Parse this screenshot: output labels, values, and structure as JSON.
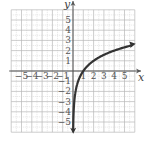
{
  "chart_data": {
    "type": "line",
    "title": "",
    "function": "y = log2(x)",
    "xlabel": "x",
    "ylabel": "y",
    "xlim": [
      -6,
      6
    ],
    "ylim": [
      -6,
      6
    ],
    "grid": true,
    "minor_grid": "dotted half-unit",
    "x_ticks": [
      "-5",
      "-4",
      "-3",
      "-2",
      "-1",
      "1",
      "2",
      "3",
      "4",
      "5"
    ],
    "y_ticks": [
      "5",
      "4",
      "3",
      "2",
      "1",
      "-1",
      "-2",
      "-3",
      "-4",
      "-5"
    ],
    "series": [
      {
        "name": "curve",
        "x": [
          0.02,
          0.05,
          0.1,
          0.25,
          0.5,
          1,
          2,
          3,
          4,
          5,
          5.8
        ],
        "y": [
          -5.64,
          -4.32,
          -3.32,
          -2,
          -1,
          0,
          1,
          1.58,
          2,
          2.32,
          2.54
        ],
        "arrows": "both ends"
      }
    ],
    "colors": {
      "curve": "#333333",
      "axes": "#555555",
      "grid": "#bbbbbb"
    }
  }
}
